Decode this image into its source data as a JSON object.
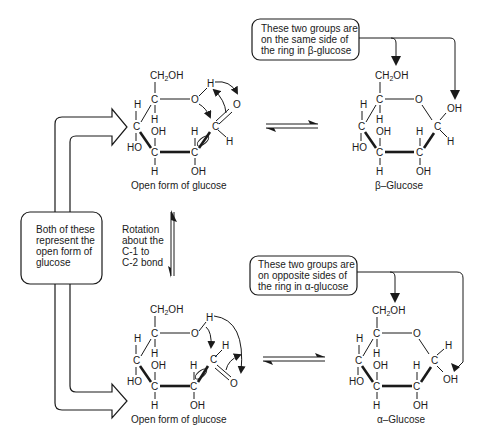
{
  "figure": {
    "left_callout": {
      "lines": [
        "Both of these",
        "represent the",
        "open form of",
        "glucose"
      ]
    },
    "rotation_label": {
      "lines": [
        "Rotation",
        "about the",
        "C-1 to",
        "C-2 bond"
      ]
    },
    "beta_callout": {
      "lines": [
        "These two groups are",
        "on the same side of",
        "the ring in β-glucose"
      ]
    },
    "alpha_callout": {
      "lines": [
        "These two groups are",
        "on opposite sides of",
        "the ring in α-glucose"
      ]
    },
    "structures": {
      "open_top": {
        "caption": "Open form of glucose"
      },
      "beta": {
        "caption": "β–Glucose"
      },
      "open_bottom": {
        "caption": "Open form of glucose"
      },
      "alpha": {
        "caption": "α–Glucose"
      }
    },
    "atoms": {
      "ch2": "CH",
      "two": "2",
      "oh": "OH",
      "ho": "HO",
      "c": "C",
      "h": "H",
      "o": "O"
    }
  }
}
